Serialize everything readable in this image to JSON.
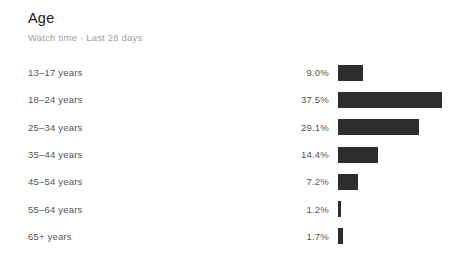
{
  "header": {
    "title": "Age",
    "subtitle": "Watch time · Last 28 days"
  },
  "chart_data": {
    "type": "bar",
    "orientation": "horizontal",
    "title": "Age",
    "subtitle": "Watch time · Last 28 days",
    "categories": [
      "13–17 years",
      "18–24 years",
      "25–34 years",
      "35–44 years",
      "45–54 years",
      "55–64 years",
      "65+ years"
    ],
    "values": [
      9.0,
      37.5,
      29.1,
      14.4,
      7.2,
      1.2,
      1.7
    ],
    "value_labels": [
      "9.0%",
      "37.5%",
      "29.1%",
      "14.4%",
      "7.2%",
      "1.2%",
      "1.7%"
    ],
    "unit": "%",
    "xlim": [
      0,
      37.5
    ],
    "grid": false,
    "legend": false,
    "bar_color": "#2d2d2d"
  },
  "colors": {
    "background": "#ffffff",
    "title": "#212121",
    "subtitle": "#9e9e9e",
    "label": "#565656",
    "bar": "#2d2d2d"
  }
}
